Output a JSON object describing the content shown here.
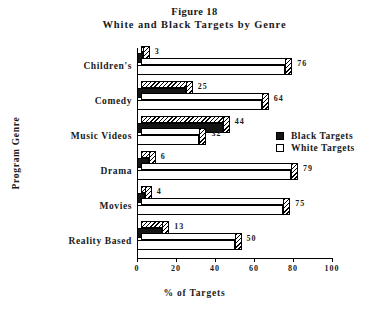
{
  "chart_data": {
    "type": "bar",
    "orientation": "horizontal",
    "title": "Figure 18",
    "subtitle": "White and Black Targets by Genre",
    "xlabel": "% of Targets",
    "ylabel": "Program Genre",
    "xlim": [
      0,
      100
    ],
    "xticks": [
      0,
      20,
      40,
      60,
      80,
      100
    ],
    "xtick_labels": [
      "0",
      "20",
      "40",
      "60",
      "80",
      "100"
    ],
    "grid": false,
    "legend_position": "middle-right",
    "categories": [
      "Children's",
      "Comedy",
      "Music Videos",
      "Drama",
      "Movies",
      "Reality Based"
    ],
    "series": [
      {
        "name": "Black Targets",
        "color": "#151515",
        "values": [
          3,
          25,
          44,
          6,
          4,
          13
        ],
        "value_labels": [
          "3",
          "25",
          "44",
          "6",
          "4",
          "13"
        ]
      },
      {
        "name": "White Targets",
        "color": "#ffffff",
        "values": [
          76,
          64,
          32,
          79,
          75,
          50
        ],
        "value_labels": [
          "76",
          "64",
          "32",
          "79",
          "75",
          "50"
        ]
      }
    ]
  },
  "legend": {
    "items": [
      {
        "label": "Black Targets",
        "swatch": "black"
      },
      {
        "label": "White Targets",
        "swatch": "white"
      }
    ]
  }
}
